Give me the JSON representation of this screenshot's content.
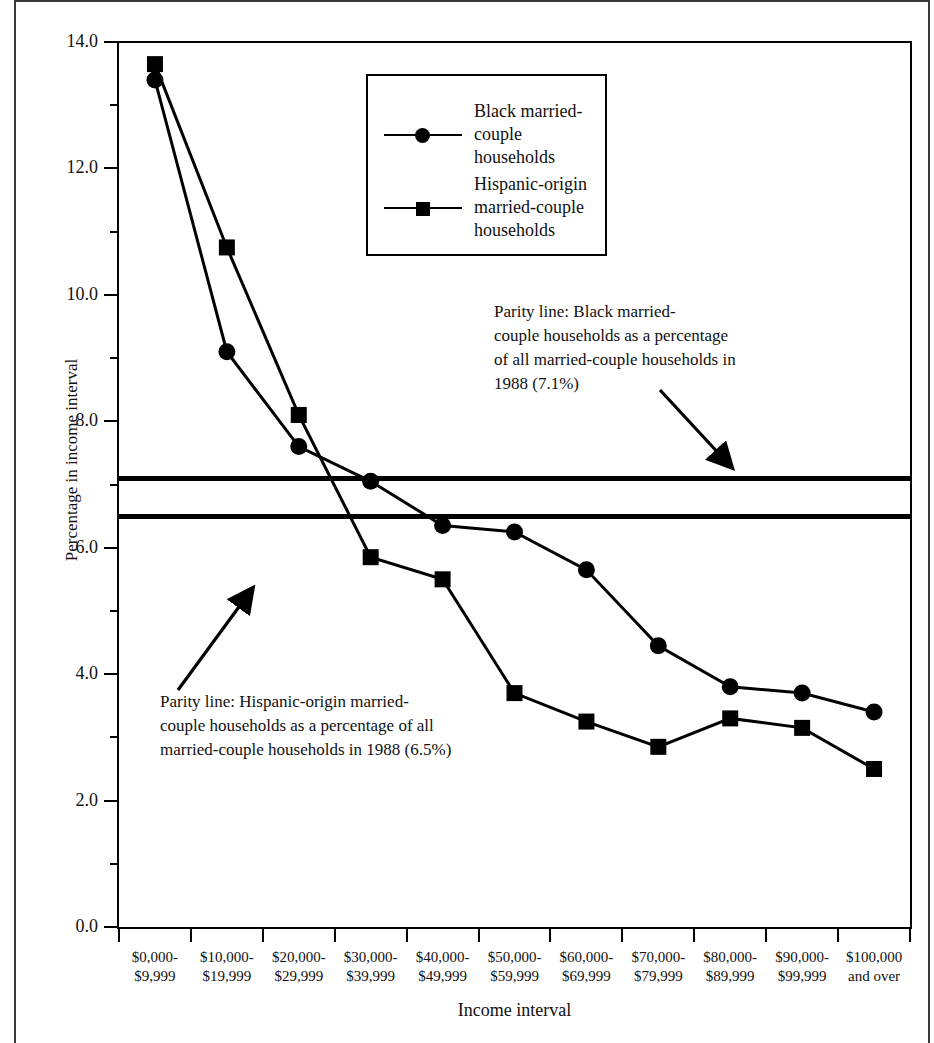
{
  "chart_data": {
    "type": "line",
    "title": "",
    "xlabel": "Income interval",
    "ylabel": "Percentage in income interval",
    "ylim": [
      0.0,
      14.0
    ],
    "ytick_labels": [
      "0.0",
      "2.0",
      "4.0",
      "6.0",
      "8.0",
      "10.0",
      "12.0",
      "14.0"
    ],
    "ytick_values": [
      0.0,
      2.0,
      4.0,
      6.0,
      8.0,
      10.0,
      12.0,
      14.0
    ],
    "yminor_values": [
      1.0,
      3.0,
      5.0,
      7.0,
      9.0,
      11.0,
      13.0
    ],
    "grid": false,
    "legend_position": "upper-center",
    "categories": [
      "$0,000-\n$9,999",
      "$10,000-\n$19,999",
      "$20,000-\n$29,999",
      "$30,000-\n$39,999",
      "$40,000-\n$49,999",
      "$50,000-\n$59,999",
      "$60,000-\n$69,999",
      "$70,000-\n$79,999",
      "$80,000-\n$89,999",
      "$90,000-\n$99,999",
      "$100,000\nand over"
    ],
    "series": [
      {
        "name": "Black married-couple households",
        "marker": "circle",
        "values": [
          13.4,
          9.1,
          7.6,
          7.05,
          6.35,
          6.25,
          5.65,
          4.45,
          3.8,
          3.7,
          3.4
        ]
      },
      {
        "name": "Hispanic-origin married-couple households",
        "marker": "square",
        "values": [
          13.65,
          10.75,
          8.1,
          5.85,
          5.5,
          3.7,
          3.25,
          2.85,
          3.3,
          3.15,
          2.5
        ]
      }
    ],
    "reference_lines": [
      {
        "name": "black-parity-line",
        "value": 7.1,
        "label": "7.1%"
      },
      {
        "name": "hispanic-parity-line",
        "value": 6.5,
        "label": "6.5%"
      }
    ],
    "annotations": [
      {
        "name": "black-parity-annotation",
        "text": "Parity line: Black married-\ncouple households as a percentage\nof all married-couple households in\n1988  (7.1%)"
      },
      {
        "name": "hispanic-parity-annotation",
        "text": "Parity line: Hispanic-origin  married-\ncouple households as a percentage of all\nmarried-couple households in 1988 (6.5%)"
      }
    ]
  },
  "legend": {
    "items": [
      {
        "label": "Black married-\ncouple households",
        "marker": "circle"
      },
      {
        "label": "Hispanic-origin\nmarried-couple\nhouseholds",
        "marker": "square"
      }
    ]
  },
  "colors": {
    "ink": "#000000",
    "background": "#ffffff",
    "border": "#3a3a3a"
  },
  "bottom_caption": ""
}
